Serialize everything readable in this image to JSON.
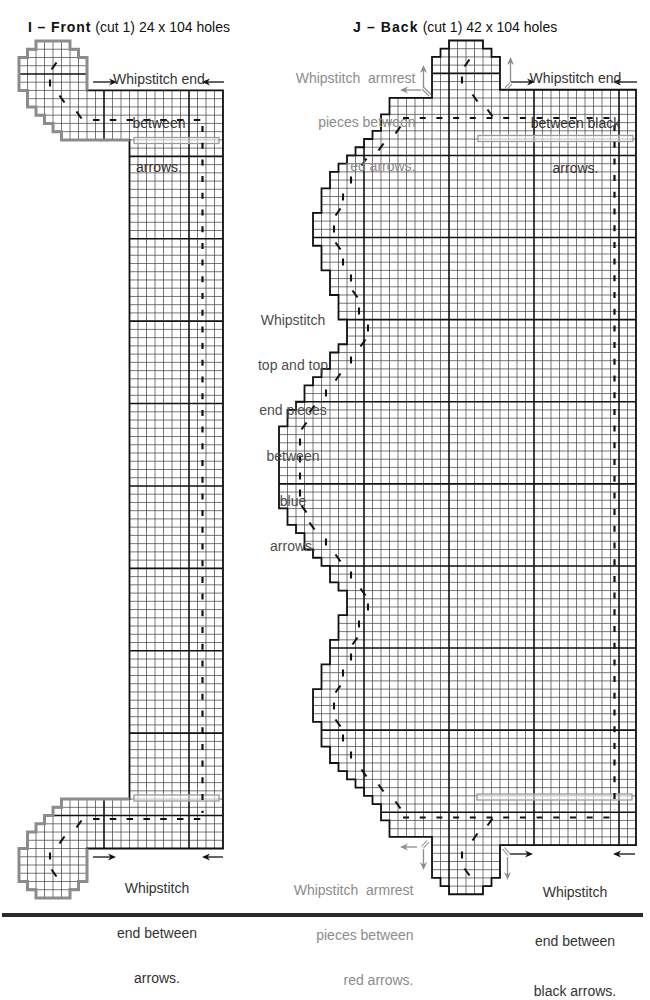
{
  "pieces": {
    "front": {
      "title_bold": "I – Front",
      "title_detail": "(cut 1) 24 x 104 holes",
      "cut": 1,
      "width_holes": 24,
      "height_holes": 104,
      "outline": [
        [
          2,
          0
        ],
        [
          6,
          0
        ],
        [
          6,
          1
        ],
        [
          7,
          1
        ],
        [
          7,
          2
        ],
        [
          8,
          2
        ],
        [
          8,
          6
        ],
        [
          24,
          6
        ],
        [
          24,
          98
        ],
        [
          8,
          98
        ],
        [
          8,
          102
        ],
        [
          7,
          102
        ],
        [
          7,
          103
        ],
        [
          6,
          103
        ],
        [
          6,
          104
        ],
        [
          2,
          104
        ],
        [
          2,
          103
        ],
        [
          1,
          103
        ],
        [
          1,
          102
        ],
        [
          0,
          102
        ],
        [
          0,
          98
        ],
        [
          1,
          98
        ],
        [
          1,
          96
        ],
        [
          2,
          96
        ],
        [
          2,
          95
        ],
        [
          3,
          95
        ],
        [
          3,
          94
        ],
        [
          4,
          94
        ],
        [
          4,
          93
        ],
        [
          5,
          93
        ],
        [
          5,
          92
        ],
        [
          13,
          92
        ],
        [
          13,
          12
        ],
        [
          5,
          12
        ],
        [
          5,
          11
        ],
        [
          4,
          11
        ],
        [
          4,
          10
        ],
        [
          3,
          10
        ],
        [
          3,
          9
        ],
        [
          2,
          9
        ],
        [
          2,
          8
        ],
        [
          1,
          8
        ],
        [
          1,
          6
        ],
        [
          0,
          6
        ],
        [
          0,
          2
        ],
        [
          1,
          2
        ],
        [
          1,
          1
        ],
        [
          2,
          1
        ]
      ],
      "gray_edges": [
        [
          [
            8,
            6
          ],
          [
            8,
            2
          ],
          [
            7,
            2
          ],
          [
            7,
            1
          ],
          [
            6,
            1
          ],
          [
            6,
            0
          ],
          [
            2,
            0
          ],
          [
            2,
            1
          ],
          [
            1,
            1
          ],
          [
            1,
            2
          ],
          [
            0,
            2
          ],
          [
            0,
            6
          ],
          [
            1,
            6
          ],
          [
            1,
            8
          ],
          [
            2,
            8
          ],
          [
            2,
            9
          ],
          [
            3,
            9
          ],
          [
            3,
            10
          ],
          [
            4,
            10
          ],
          [
            4,
            11
          ],
          [
            5,
            11
          ],
          [
            5,
            12
          ],
          [
            13,
            12
          ]
        ],
        [
          [
            8,
            98
          ],
          [
            8,
            102
          ],
          [
            7,
            102
          ],
          [
            7,
            103
          ],
          [
            6,
            103
          ],
          [
            6,
            104
          ],
          [
            2,
            104
          ],
          [
            2,
            103
          ],
          [
            1,
            103
          ],
          [
            1,
            102
          ],
          [
            0,
            102
          ],
          [
            0,
            98
          ],
          [
            1,
            98
          ],
          [
            1,
            96
          ],
          [
            2,
            96
          ],
          [
            2,
            95
          ],
          [
            3,
            95
          ],
          [
            3,
            94
          ],
          [
            4,
            94
          ],
          [
            4,
            93
          ],
          [
            5,
            93
          ],
          [
            5,
            92
          ],
          [
            13,
            92
          ]
        ]
      ],
      "notes": {
        "top": [
          "Whipstitch end",
          "between",
          "arrows."
        ],
        "bottom": [
          "Whipstitch",
          "end between",
          "arrows."
        ]
      }
    },
    "back": {
      "title_bold": "J – Back",
      "title_detail": "(cut 1) 42 x 104 holes",
      "cut": 1,
      "width_holes": 42,
      "height_holes": 104,
      "outline": [
        [
          20,
          0
        ],
        [
          24,
          0
        ],
        [
          24,
          1
        ],
        [
          25,
          1
        ],
        [
          25,
          2
        ],
        [
          26,
          2
        ],
        [
          26,
          6
        ],
        [
          42,
          6
        ],
        [
          42,
          98
        ],
        [
          26,
          98
        ],
        [
          26,
          102
        ],
        [
          25,
          102
        ],
        [
          25,
          103
        ],
        [
          24,
          103
        ],
        [
          24,
          104
        ],
        [
          20,
          104
        ],
        [
          20,
          103
        ],
        [
          19,
          103
        ],
        [
          19,
          102
        ],
        [
          18,
          102
        ],
        [
          18,
          97
        ],
        [
          13,
          97
        ],
        [
          13,
          95
        ],
        [
          12,
          95
        ],
        [
          12,
          93
        ],
        [
          11,
          93
        ],
        [
          11,
          92
        ],
        [
          10,
          92
        ],
        [
          10,
          91
        ],
        [
          9,
          91
        ],
        [
          9,
          90
        ],
        [
          8,
          90
        ],
        [
          8,
          89
        ],
        [
          7,
          89
        ],
        [
          7,
          88
        ],
        [
          6,
          88
        ],
        [
          6,
          86
        ],
        [
          5,
          86
        ],
        [
          5,
          83
        ],
        [
          4,
          83
        ],
        [
          4,
          79
        ],
        [
          5,
          79
        ],
        [
          5,
          76
        ],
        [
          6,
          76
        ],
        [
          6,
          73
        ],
        [
          7,
          73
        ],
        [
          7,
          70
        ],
        [
          8,
          70
        ],
        [
          8,
          67
        ],
        [
          7,
          67
        ],
        [
          7,
          66
        ],
        [
          6,
          66
        ],
        [
          6,
          64
        ],
        [
          5,
          64
        ],
        [
          5,
          63
        ],
        [
          4,
          63
        ],
        [
          4,
          62
        ],
        [
          3,
          62
        ],
        [
          3,
          60
        ],
        [
          2,
          60
        ],
        [
          2,
          59
        ],
        [
          1,
          59
        ],
        [
          1,
          57
        ],
        [
          0,
          57
        ],
        [
          0,
          47
        ],
        [
          1,
          47
        ],
        [
          1,
          45
        ],
        [
          2,
          45
        ],
        [
          2,
          44
        ],
        [
          3,
          44
        ],
        [
          3,
          42
        ],
        [
          4,
          42
        ],
        [
          4,
          41
        ],
        [
          5,
          41
        ],
        [
          5,
          40
        ],
        [
          6,
          40
        ],
        [
          6,
          38
        ],
        [
          7,
          38
        ],
        [
          7,
          37
        ],
        [
          8,
          37
        ],
        [
          8,
          34
        ],
        [
          7,
          34
        ],
        [
          7,
          31
        ],
        [
          6,
          31
        ],
        [
          6,
          28
        ],
        [
          5,
          28
        ],
        [
          5,
          25
        ],
        [
          4,
          25
        ],
        [
          4,
          21
        ],
        [
          5,
          21
        ],
        [
          5,
          18
        ],
        [
          6,
          18
        ],
        [
          6,
          16
        ],
        [
          7,
          16
        ],
        [
          7,
          15
        ],
        [
          8,
          15
        ],
        [
          8,
          14
        ],
        [
          9,
          14
        ],
        [
          9,
          13
        ],
        [
          10,
          13
        ],
        [
          10,
          12
        ],
        [
          11,
          12
        ],
        [
          11,
          11
        ],
        [
          12,
          11
        ],
        [
          12,
          9
        ],
        [
          13,
          9
        ],
        [
          13,
          7
        ],
        [
          18,
          7
        ],
        [
          18,
          2
        ],
        [
          19,
          2
        ],
        [
          19,
          1
        ],
        [
          20,
          1
        ]
      ],
      "notes": {
        "top_left": [
          "Whipstitch  armrest",
          "pieces between",
          "red arrows."
        ],
        "top_right": [
          "Whipstitch end",
          "between black",
          "arrows."
        ],
        "middle_left": [
          "Whipstitch",
          "top and top",
          "end pieces",
          "between",
          "blue",
          "arrows."
        ],
        "bottom_left": [
          "Whipstitch  armrest",
          "pieces between",
          "red arrows."
        ],
        "bottom_right": [
          "Whipstitch",
          "end between",
          "black arrows."
        ]
      }
    }
  },
  "grid": {
    "major_every": 10,
    "major_row_offset": 4
  },
  "colors": {
    "outline": "#111111",
    "grid_line": "#4a4a4a",
    "gray_outline": "#8c8c8c",
    "note_text": "#333333",
    "armrest_note": "#8c8c8c",
    "overlap_band": "#9a9a9a"
  }
}
